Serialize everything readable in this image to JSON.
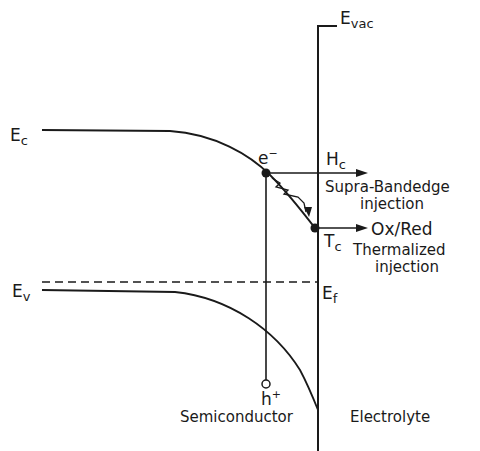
{
  "diagram": {
    "type": "band-diagram",
    "labels": {
      "evac": {
        "main": "E",
        "sub": "vac"
      },
      "ec": {
        "main": "E",
        "sub": "c"
      },
      "ev": {
        "main": "E",
        "sub": "v"
      },
      "ef": {
        "main": "E",
        "sub": "f"
      },
      "electron": {
        "main": "e",
        "sup": "−"
      },
      "hole": {
        "main": "h",
        "sup": "+"
      },
      "hc": {
        "main": "H",
        "sub": "c"
      },
      "tc": {
        "main": "T",
        "sub": "c"
      },
      "supra_line1": "Supra-Bandedge",
      "supra_line2": "injection",
      "oxred": "Ox/Red",
      "thermalized_line1": "Thermalized",
      "thermalized_line2": "injection",
      "semiconductor": "Semiconductor",
      "electrolyte": "Electrolyte"
    },
    "colors": {
      "line": "#1a1a1a",
      "background": "#ffffff"
    }
  }
}
